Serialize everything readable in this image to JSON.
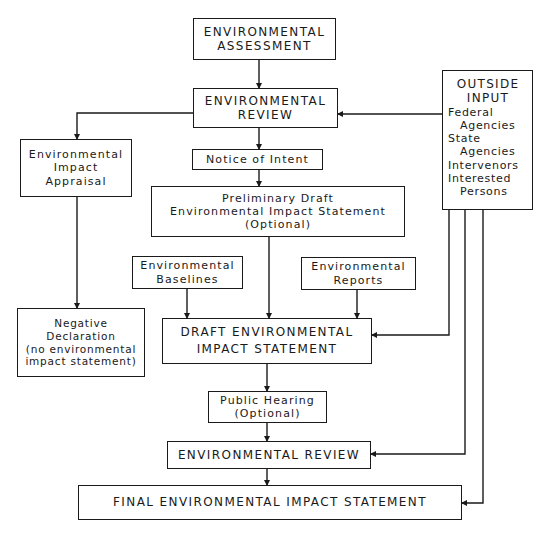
{
  "diagram": {
    "nodes": {
      "env_assessment": {
        "lines": [
          "ENVIRONMENTAL",
          "ASSESSMENT"
        ]
      },
      "env_review_1": {
        "lines": [
          "ENVIRONMENTAL",
          "REVIEW"
        ]
      },
      "impact_appraisal": {
        "lines": [
          "Environmental",
          "Impact",
          "Appraisal"
        ]
      },
      "notice_of_intent": {
        "lines": [
          "Notice of Intent"
        ]
      },
      "preliminary_draft": {
        "lines": [
          "Preliminary Draft",
          "Environmental Impact Statement",
          "(Optional)"
        ]
      },
      "baselines": {
        "lines": [
          "Environmental",
          "Baselines"
        ]
      },
      "reports": {
        "lines": [
          "Environmental",
          "Reports"
        ]
      },
      "negative_declaration": {
        "lines": [
          "Negative",
          "Declaration",
          "(no environmental",
          "impact statement)"
        ]
      },
      "draft_eis": {
        "lines": [
          "DRAFT ENVIRONMENTAL",
          "IMPACT STATEMENT"
        ]
      },
      "public_hearing": {
        "lines": [
          "Public Hearing",
          "(Optional)"
        ]
      },
      "env_review_2": {
        "lines": [
          "ENVIRONMENTAL REVIEW"
        ]
      },
      "final_eis": {
        "lines": [
          "FINAL ENVIRONMENTAL IMPACT STATEMENT"
        ]
      },
      "outside_input": {
        "heading": [
          "OUTSIDE",
          "INPUT"
        ],
        "items": [
          {
            "lines": [
              "Federal",
              "Agencies"
            ]
          },
          {
            "lines": [
              "State",
              "Agencies"
            ]
          },
          {
            "lines": [
              "Intervenors"
            ]
          },
          {
            "lines": [
              "Interested",
              "Persons"
            ]
          }
        ]
      }
    },
    "edges": [
      {
        "from": "env_assessment",
        "to": "env_review_1"
      },
      {
        "from": "outside_input",
        "to": "env_review_1"
      },
      {
        "from": "env_review_1",
        "to": "impact_appraisal"
      },
      {
        "from": "env_review_1",
        "to": "notice_of_intent"
      },
      {
        "from": "impact_appraisal",
        "to": "negative_declaration"
      },
      {
        "from": "notice_of_intent",
        "to": "preliminary_draft"
      },
      {
        "from": "preliminary_draft",
        "to": "draft_eis"
      },
      {
        "from": "baselines",
        "to": "draft_eis"
      },
      {
        "from": "reports",
        "to": "draft_eis"
      },
      {
        "from": "outside_input",
        "to": "draft_eis"
      },
      {
        "from": "draft_eis",
        "to": "public_hearing"
      },
      {
        "from": "public_hearing",
        "to": "env_review_2"
      },
      {
        "from": "outside_input",
        "to": "env_review_2"
      },
      {
        "from": "env_review_2",
        "to": "final_eis"
      },
      {
        "from": "outside_input",
        "to": "final_eis"
      }
    ],
    "colors": {
      "line": "#1a1a1a",
      "background": "#ffffff"
    }
  }
}
